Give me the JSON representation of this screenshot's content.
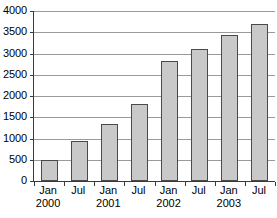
{
  "chart_data": {
    "type": "bar",
    "title": "",
    "subtitle": "",
    "xlabel": "",
    "ylabel": "",
    "categories": [
      "Jan 2000",
      "Jul 2000",
      "Jan 2001",
      "Jul 2001",
      "Jan 2002",
      "Jul 2002",
      "Jan 2003",
      "Jul 2003"
    ],
    "category_lines": [
      {
        "line1": "Jan",
        "line2": "2000"
      },
      {
        "line1": "Jul",
        "line2": ""
      },
      {
        "line1": "Jan",
        "line2": "2001"
      },
      {
        "line1": "Jul",
        "line2": ""
      },
      {
        "line1": "Jan",
        "line2": "2002"
      },
      {
        "line1": "Jul",
        "line2": ""
      },
      {
        "line1": "Jan",
        "line2": "2003"
      },
      {
        "line1": "Jul",
        "line2": ""
      }
    ],
    "values": [
      500,
      930,
      1330,
      1820,
      2830,
      3110,
      3430,
      3700
    ],
    "ylim": [
      0,
      4000
    ],
    "yticks": [
      0,
      500,
      1000,
      1500,
      2000,
      2500,
      3000,
      3500,
      4000
    ],
    "ytick_labels": [
      "0",
      "500",
      "1000",
      "1500",
      "2000",
      "2500",
      "3000",
      "3500",
      "4000"
    ],
    "grid": "horizontal",
    "legend": "none",
    "bar_fill_color": "#c9c9c9",
    "bar_edge_color": "#4a4a4a",
    "gridline_color": "#9a9a9a",
    "axis_color": "#3a3a3a",
    "background_color": "#ffffff"
  }
}
